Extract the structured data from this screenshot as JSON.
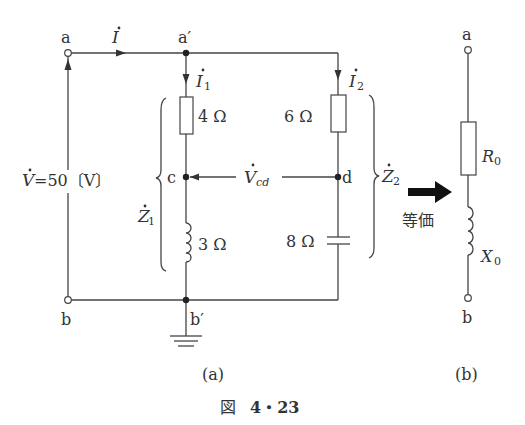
{
  "figure": {
    "caption_prefix": "図",
    "caption_number": "4・23",
    "subfig_a": "(a)",
    "subfig_b": "(b)"
  },
  "circuit_a": {
    "terminal_a": "a",
    "terminal_b": "b",
    "node_a_prime": "a′",
    "node_b_prime": "b′",
    "node_c": "c",
    "node_d": "d",
    "current_total": "I",
    "current_1": "I",
    "current_1_sub": "1",
    "current_2": "I",
    "current_2_sub": "2",
    "source_voltage": "V=50〔V〕",
    "source_voltage_symbol": "V",
    "source_voltage_value": "=50〔V〕",
    "r1": "4 Ω",
    "x1": "3 Ω",
    "r2": "6 Ω",
    "xc2": "8 Ω",
    "vcd": "V",
    "vcd_sub": "cd",
    "z1": "Z",
    "z1_sub": "1",
    "z2": "Z",
    "z2_sub": "2"
  },
  "arrow": {
    "label": "等価"
  },
  "circuit_b": {
    "terminal_a": "a",
    "terminal_b": "b",
    "r0": "R",
    "r0_sub": "0",
    "x0": "X",
    "x0_sub": "0"
  }
}
